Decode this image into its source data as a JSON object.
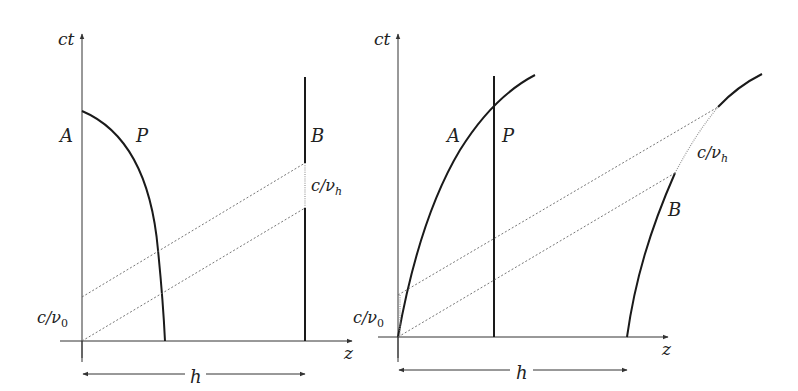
{
  "figure": {
    "panels": [
      {
        "id": "left",
        "axis_labels": {
          "vertical": "ct",
          "horizontal": "z"
        },
        "worldline_labels": {
          "A": "A",
          "P": "P",
          "B": "B"
        },
        "interval_labels": {
          "emitter": "c/ν",
          "emitter_sub": "0",
          "receiver": "c/ν",
          "receiver_sub": "h"
        },
        "distance_label": "h"
      },
      {
        "id": "right",
        "axis_labels": {
          "vertical": "ct",
          "horizontal": "z"
        },
        "worldline_labels": {
          "A": "A",
          "P": "P",
          "B": "B"
        },
        "interval_labels": {
          "emitter": "c/ν",
          "emitter_sub": "0",
          "receiver": "c/ν",
          "receiver_sub": "h"
        },
        "distance_label": "h"
      }
    ],
    "colors": {
      "ink": "#1a1a1a",
      "axis": "#333333",
      "dotted": "#666666",
      "background": "#ffffff"
    }
  }
}
